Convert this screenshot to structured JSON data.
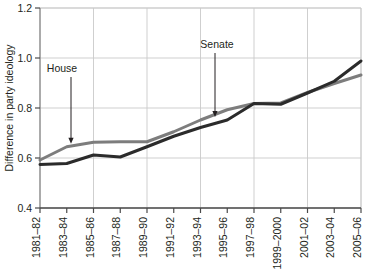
{
  "chart_data": {
    "type": "line",
    "title": "",
    "xlabel": "",
    "ylabel": "Difference in party ideology",
    "categories": [
      "1981–82",
      "1983–84",
      "1985–86",
      "1987–88",
      "1989–90",
      "1991–92",
      "1993–94",
      "1995–96",
      "1997–98",
      "1999–2000",
      "2001–02",
      "2003–04",
      "2005–06"
    ],
    "ylim": [
      0.4,
      1.2
    ],
    "yticks": [
      "0.4",
      "0.6",
      "0.8",
      "1.0",
      "1.2"
    ],
    "ytick_values": [
      0.4,
      0.6,
      0.8,
      1.0,
      1.2
    ],
    "grid": true,
    "legend": "none",
    "series": [
      {
        "name": "House",
        "color": "#7d7d7d",
        "values": [
          0.592,
          0.645,
          0.663,
          0.665,
          0.665,
          0.705,
          0.752,
          0.793,
          0.818,
          0.82,
          0.862,
          0.898,
          0.932
        ]
      },
      {
        "name": "Senate",
        "color": "#2b2b2b",
        "values": [
          0.574,
          0.578,
          0.612,
          0.604,
          0.645,
          0.687,
          0.722,
          0.752,
          0.818,
          0.815,
          0.86,
          0.907,
          0.988
        ]
      }
    ],
    "annotations": [
      {
        "label": "House",
        "target_series": "House",
        "target_category": "1983–84"
      },
      {
        "label": "Senate",
        "target_series": "Senate",
        "target_category": "1995–96"
      }
    ]
  }
}
